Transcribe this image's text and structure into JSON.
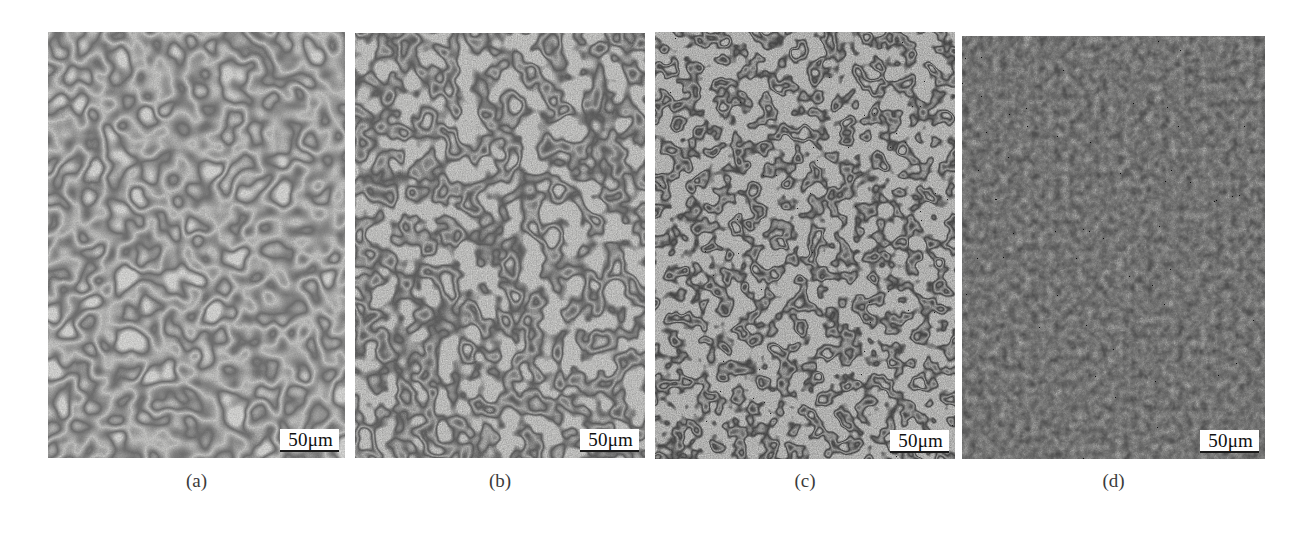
{
  "figure": {
    "type": "micrograph-panel-figure",
    "panel_count": 4,
    "background_color": "#ffffff"
  },
  "panels": [
    {
      "id": "a",
      "caption": "(a)",
      "scalebar_label": "50μm",
      "appearance": {
        "base_color": "#d8d8d6",
        "boundary_color": "#6b6b6b",
        "mean_gray": "#d2d2d0",
        "grain_texture": "coarse",
        "grain_cell_size": 26,
        "boundary_thickness": 1.6,
        "contrast": "light",
        "noise_seed": 11
      }
    },
    {
      "id": "b",
      "caption": "(b)",
      "scalebar_label": "50μm",
      "appearance": {
        "base_color": "#cfcfcd",
        "boundary_color": "#5a5a5a",
        "mean_gray": "#c4c4c2",
        "grain_texture": "medium",
        "grain_cell_size": 20,
        "boundary_thickness": 2.3,
        "contrast": "medium",
        "noise_seed": 23
      }
    },
    {
      "id": "c",
      "caption": "(c)",
      "scalebar_label": "50μm",
      "appearance": {
        "base_color": "#cacac8",
        "boundary_color": "#4a4a4a",
        "mean_gray": "#bdbdbb",
        "grain_texture": "fine",
        "grain_cell_size": 15,
        "boundary_thickness": 2.1,
        "contrast": "medium-high",
        "noise_seed": 37
      }
    },
    {
      "id": "d",
      "caption": "(d)",
      "scalebar_label": "50μm",
      "appearance": {
        "base_color": "#b0b0ae",
        "boundary_color": "#3c3c3c",
        "mean_gray": "#a8a8a6",
        "grain_texture": "very-fine",
        "grain_cell_size": 9,
        "boundary_thickness": 1.2,
        "contrast": "dark-uniform",
        "noise_seed": 59
      }
    }
  ],
  "scalebar": {
    "label": "50μm",
    "text_color": "#101010",
    "box_color": "#ffffff",
    "rule_color": "#1a1a1a"
  },
  "captions": {
    "text_color": "#3b3b3b",
    "font_size_px": 19
  }
}
